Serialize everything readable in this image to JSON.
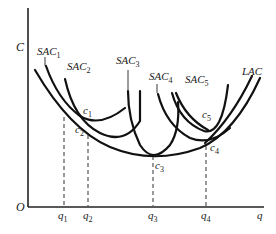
{
  "diagram": {
    "axes": {
      "y_label": "C",
      "x_label": "q",
      "origin_label": "O"
    },
    "curves": [
      {
        "id": "sac1",
        "base": "SAC",
        "sub": "1"
      },
      {
        "id": "sac2",
        "base": "SAC",
        "sub": "2"
      },
      {
        "id": "sac3",
        "base": "SAC",
        "sub": "3"
      },
      {
        "id": "sac4",
        "base": "SAC",
        "sub": "4"
      },
      {
        "id": "sac5",
        "base": "SAC",
        "sub": "5"
      },
      {
        "id": "lac",
        "base": "LAC",
        "sub": ""
      }
    ],
    "points": [
      {
        "base": "c",
        "sub": "1"
      },
      {
        "base": "c",
        "sub": "2"
      },
      {
        "base": "c",
        "sub": "3"
      },
      {
        "base": "c",
        "sub": "4"
      },
      {
        "base": "c",
        "sub": "5"
      }
    ],
    "x_ticks": [
      {
        "base": "q",
        "sub": "1"
      },
      {
        "base": "q",
        "sub": "2"
      },
      {
        "base": "q",
        "sub": "3"
      },
      {
        "base": "q",
        "sub": "4"
      }
    ],
    "colors": {
      "ink": "#111111",
      "background": "#ffffff"
    }
  }
}
